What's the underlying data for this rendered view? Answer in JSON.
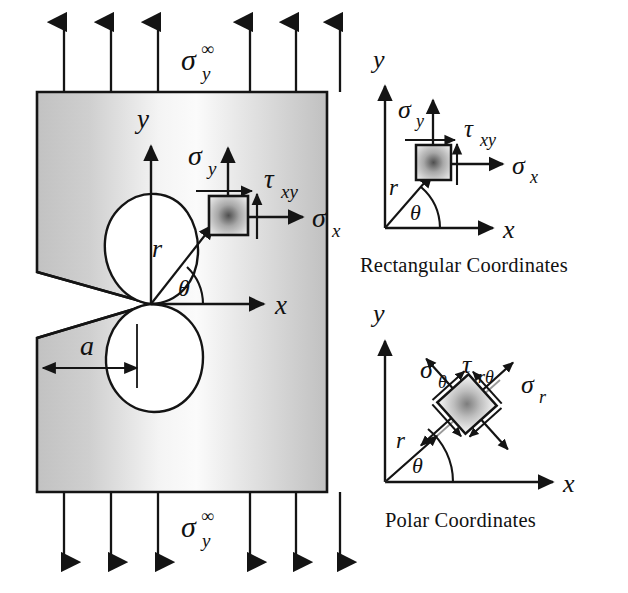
{
  "figure": {
    "background_color": "#ffffff",
    "ink_color": "#141414"
  },
  "main_panel": {
    "name": "cracked-plate-panel",
    "plate": {
      "fill_light": "#ffffff",
      "fill_gray": "#c9c9c9",
      "border_color": "#141414"
    },
    "far_field_stress_top_label": "σ",
    "far_field_stress_top_sub": "y",
    "far_field_stress_top_sup": "∞",
    "far_field_stress_bottom_label": "σ",
    "far_field_stress_bottom_sub": "y",
    "far_field_stress_bottom_sup": "∞",
    "arrow_count_top": 6,
    "arrow_count_bottom": 6,
    "axis_y_label": "y",
    "axis_x_label": "x",
    "radius_label": "r",
    "angle_label": "θ",
    "crack_length_label": "a",
    "element_stress_sigma_y": "σ",
    "element_stress_sigma_y_sub": "y",
    "element_stress_sigma_x": "σ",
    "element_stress_sigma_x_sub": "x",
    "element_stress_tau_xy": "τ",
    "element_stress_tau_xy_sub": "xy"
  },
  "rect_panel": {
    "name": "rectangular-coordinates-panel",
    "caption": "Rectangular  Coordinates",
    "axis_y_label": "y",
    "axis_x_label": "x",
    "radius_label": "r",
    "angle_label": "θ",
    "sigma_y": "σ",
    "sigma_y_sub": "y",
    "sigma_x": "σ",
    "sigma_x_sub": "x",
    "tau_xy": "τ",
    "tau_xy_sub": "xy"
  },
  "polar_panel": {
    "name": "polar-coordinates-panel",
    "caption": "Polar Coordinates",
    "axis_y_label": "y",
    "axis_x_label": "x",
    "radius_label": "r",
    "angle_label": "θ",
    "sigma_theta": "σ",
    "sigma_theta_sub": "θ",
    "sigma_r": "σ",
    "sigma_r_sub": "r",
    "tau_rtheta": "τ",
    "tau_rtheta_sub": "rθ"
  }
}
